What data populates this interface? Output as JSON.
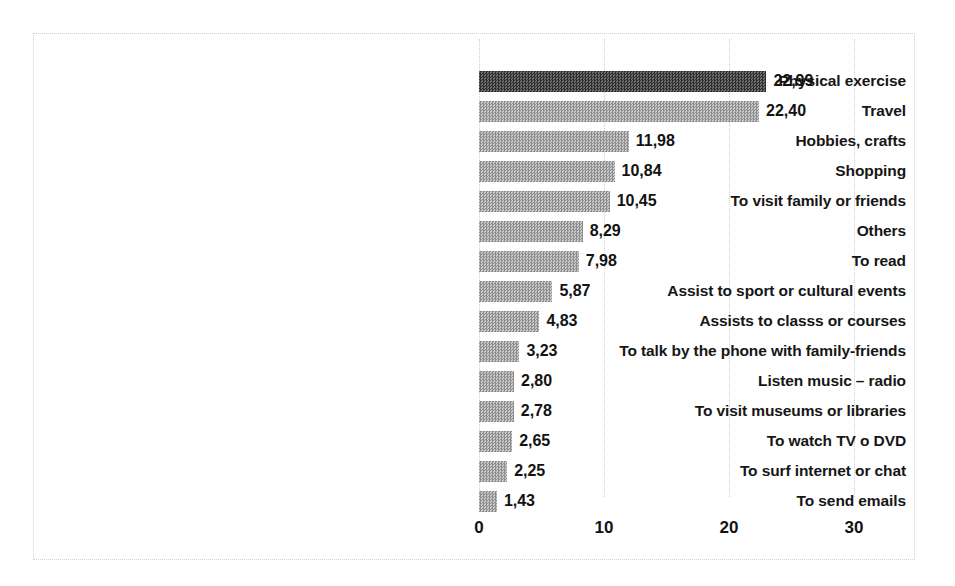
{
  "chart_data": {
    "type": "bar",
    "orientation": "horizontal",
    "title": "",
    "subtitle": "",
    "xlabel": "",
    "ylabel": "",
    "xlim": [
      0,
      33.5
    ],
    "xticks": [
      "0",
      "10",
      "20",
      "30"
    ],
    "xtick_values": [
      0,
      10,
      20,
      30
    ],
    "grid": true,
    "gridlines": "vertical-dotted",
    "legend": "none",
    "value_label_format": "comma-decimal",
    "categories": [
      "Physical exercise",
      "Travel",
      "Hobbies, crafts",
      "Shopping",
      "To visit family or friends",
      "Others",
      "To read",
      "Assist to sport or cultural events",
      "Assists to classs or courses",
      "To talk by the phone with family-friends",
      "Listen music – radio",
      "To visit museums or libraries",
      "To watch TV o DVD",
      "To surf internet or chat",
      "To send emails"
    ],
    "values": [
      22.99,
      22.4,
      11.98,
      10.84,
      10.45,
      8.29,
      7.98,
      5.87,
      4.83,
      3.23,
      2.8,
      2.78,
      2.65,
      2.25,
      1.43
    ],
    "value_labels": [
      "22,99",
      "22,40",
      "11,98",
      "10,84",
      "10,45",
      "8,29",
      "7,98",
      "5,87",
      "4,83",
      "3,23",
      "2,80",
      "2,78",
      "2,65",
      "2,25",
      "1,43"
    ],
    "bar_styles": [
      "dark",
      "light",
      "light",
      "light",
      "light",
      "light",
      "light",
      "light",
      "light",
      "light",
      "light",
      "light",
      "light",
      "light",
      "light"
    ],
    "colors": {
      "bar_light": "#a6a6a6",
      "bar_dark": "#4a4a4a",
      "text": "#121212",
      "gridline": "#cfcfcf",
      "frame_border": "#d2d2d2",
      "background": "#ffffff"
    }
  }
}
